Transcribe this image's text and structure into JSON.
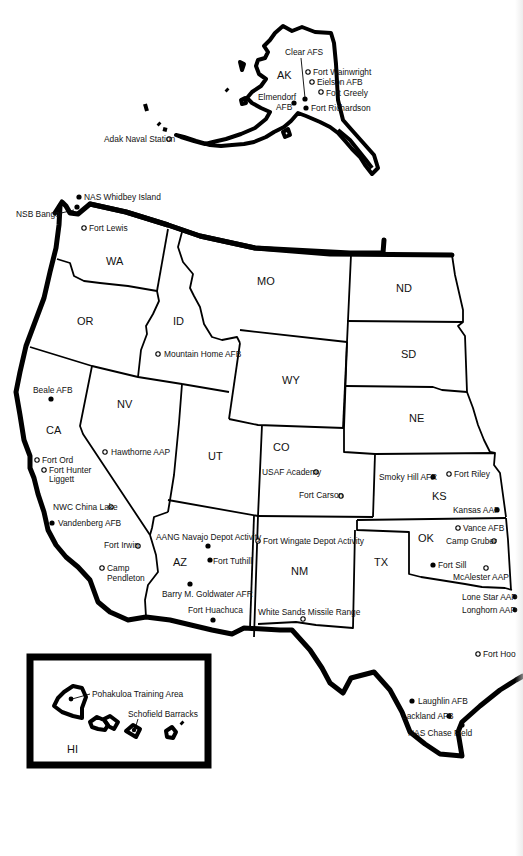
{
  "map": {
    "legend": {
      "filled_dot": "installation (filled marker)",
      "open_dot": "installation (open marker)"
    },
    "states": [
      {
        "code": "AK",
        "x": 277,
        "y": 79
      },
      {
        "code": "WA",
        "x": 107,
        "y": 265
      },
      {
        "code": "OR",
        "x": 84,
        "y": 323
      },
      {
        "code": "ID",
        "x": 177,
        "y": 323
      },
      {
        "code": "MO",
        "x": 264,
        "y": 284
      },
      {
        "code": "ND",
        "x": 403,
        "y": 291
      },
      {
        "code": "SD",
        "x": 407,
        "y": 357
      },
      {
        "code": "WY",
        "x": 290,
        "y": 383
      },
      {
        "code": "NE",
        "x": 415,
        "y": 421
      },
      {
        "code": "CA",
        "x": 53,
        "y": 433
      },
      {
        "code": "NV",
        "x": 123,
        "y": 406
      },
      {
        "code": "UT",
        "x": 215,
        "y": 459
      },
      {
        "code": "CO",
        "x": 280,
        "y": 450
      },
      {
        "code": "KS",
        "x": 438,
        "y": 499
      },
      {
        "code": "OK",
        "x": 425,
        "y": 541
      },
      {
        "code": "TX",
        "x": 381,
        "y": 565
      },
      {
        "code": "AZ",
        "x": 180,
        "y": 565
      },
      {
        "code": "NM",
        "x": 298,
        "y": 574
      },
      {
        "code": "HI",
        "x": 69,
        "y": 754
      }
    ],
    "sites": [
      {
        "name": "Clear AFS",
        "state": "AK",
        "marker": "filled",
        "dx": 305,
        "dy": 99,
        "lx": 283,
        "ly": 53
      },
      {
        "name": "Fort Wainwright",
        "state": "AK",
        "marker": "open",
        "dx": 308,
        "dy": 72,
        "lx": 314,
        "ly": 75
      },
      {
        "name": "Eielson AFB",
        "state": "AK",
        "marker": "open",
        "dx": 312,
        "dy": 82,
        "lx": 318,
        "ly": 85
      },
      {
        "name": "Fort Greely",
        "state": "AK",
        "marker": "open",
        "dx": 321,
        "dy": 92,
        "lx": 327,
        "ly": 95
      },
      {
        "name": "Elmendorf AFB",
        "state": "AK",
        "marker": "filled",
        "dx": 294,
        "dy": 103,
        "lx": 258,
        "ly": 98
      },
      {
        "name": "Fort Richardson",
        "state": "AK",
        "marker": "filled",
        "dx": 306,
        "dy": 108,
        "lx": 312,
        "ly": 111
      },
      {
        "name": "Adak Naval Station",
        "state": "AK",
        "marker": "open",
        "dx": 169,
        "dy": 139,
        "lx": 104,
        "ly": 142
      },
      {
        "name": "NAS Whidbey Island",
        "state": "WA",
        "marker": "filled",
        "dx": 79,
        "dy": 197,
        "lx": 85,
        "ly": 200
      },
      {
        "name": "NSB Bangor",
        "state": "WA",
        "marker": "filled",
        "dx": 77,
        "dy": 207,
        "lx": 16,
        "ly": 216
      },
      {
        "name": "Fort Lewis",
        "state": "WA",
        "marker": "open",
        "dx": 84,
        "dy": 228,
        "lx": 90,
        "ly": 231
      },
      {
        "name": "Mountain Home AFB",
        "state": "ID",
        "marker": "open",
        "dx": 159,
        "dy": 353,
        "lx": 165,
        "ly": 356
      },
      {
        "name": "Beale AFB",
        "state": "CA",
        "marker": "filled",
        "dx": 51,
        "dy": 399,
        "lx": 33,
        "ly": 392
      },
      {
        "name": "Hawthorne AAP",
        "state": "NV",
        "marker": "open",
        "dx": 105,
        "dy": 452,
        "lx": 111,
        "ly": 455
      },
      {
        "name": "Fort Ord",
        "state": "CA",
        "marker": "open",
        "dx": 37,
        "dy": 460,
        "lx": 42,
        "ly": 463
      },
      {
        "name": "Fort Hunter Liggett",
        "state": "CA",
        "marker": "open",
        "dx": 44,
        "dy": 470,
        "lx": 49,
        "ly": 473
      },
      {
        "name": "NWC China Lake",
        "state": "CA",
        "marker": "open",
        "dx": 111,
        "dy": 507,
        "lx": 53,
        "ly": 510
      },
      {
        "name": "Vandenberg AFB",
        "state": "CA",
        "marker": "filled",
        "dx": 52,
        "dy": 523,
        "lx": 58,
        "ly": 526
      },
      {
        "name": "Fort Irwin",
        "state": "CA",
        "marker": "open",
        "dx": 138,
        "dy": 546,
        "lx": 104,
        "ly": 548
      },
      {
        "name": "Camp Pendleton",
        "state": "CA",
        "marker": "open",
        "dx": 102,
        "dy": 568,
        "lx": 107,
        "ly": 571
      },
      {
        "name": "AANG Navajo Depot Activity",
        "state": "AZ",
        "marker": "filled",
        "dx": 208,
        "dy": 546,
        "lx": 157,
        "ly": 539
      },
      {
        "name": "Fort Tuthill",
        "state": "AZ",
        "marker": "filled",
        "dx": 210,
        "dy": 560,
        "lx": 213,
        "ly": 563
      },
      {
        "name": "Barry M. Goldwater AFR",
        "state": "AZ",
        "marker": "filled",
        "dx": 190,
        "dy": 584,
        "lx": 162,
        "ly": 597
      },
      {
        "name": "Fort Huachuca",
        "state": "AZ",
        "marker": "filled",
        "dx": 213,
        "dy": 620,
        "lx": 188,
        "ly": 613
      },
      {
        "name": "Fort Wingate Depot Activity",
        "state": "NM",
        "marker": "open",
        "dx": 258,
        "dy": 541,
        "lx": 264,
        "ly": 544
      },
      {
        "name": "White Sands Missile Range",
        "state": "NM",
        "marker": "open",
        "dx": 303,
        "dy": 619,
        "lx": 258,
        "ly": 615
      },
      {
        "name": "USAF Academy",
        "state": "CO",
        "marker": "open",
        "dx": 316,
        "dy": 472,
        "lx": 262,
        "ly": 475
      },
      {
        "name": "Fort Carson",
        "state": "CO",
        "marker": "open",
        "dx": 341,
        "dy": 496,
        "lx": 299,
        "ly": 498
      },
      {
        "name": "Smoky Hill AFR",
        "state": "KS",
        "marker": "filled",
        "dx": 433,
        "dy": 477,
        "lx": 379,
        "ly": 480
      },
      {
        "name": "Fort Riley",
        "state": "KS",
        "marker": "open",
        "dx": 449,
        "dy": 474,
        "lx": 454,
        "ly": 477
      },
      {
        "name": "Kansas AAP",
        "state": "KS",
        "marker": "filled",
        "dx": 497,
        "dy": 510,
        "lx": 453,
        "ly": 513
      },
      {
        "name": "Vance AFB",
        "state": "OK",
        "marker": "open",
        "dx": 458,
        "dy": 528,
        "lx": 463,
        "ly": 531
      },
      {
        "name": "Camp Gruber",
        "state": "OK",
        "marker": "open",
        "dx": 494,
        "dy": 541,
        "lx": 446,
        "ly": 544
      },
      {
        "name": "Fort Sill",
        "state": "OK",
        "marker": "filled",
        "dx": 433,
        "dy": 565,
        "lx": 438,
        "ly": 568
      },
      {
        "name": "McAlester AAP",
        "state": "OK",
        "marker": "open",
        "dx": 486,
        "dy": 568,
        "lx": 453,
        "ly": 580
      },
      {
        "name": "Lone Star AAP",
        "state": "TX",
        "marker": "filled",
        "dx": 514,
        "dy": 597,
        "lx": 462,
        "ly": 600
      },
      {
        "name": "Longhorn AAP",
        "state": "TX",
        "marker": "filled",
        "dx": 514,
        "dy": 610,
        "lx": 462,
        "ly": 613
      },
      {
        "name": "Fort Hood",
        "state": "TX",
        "marker": "open",
        "dx": 478,
        "dy": 654,
        "lx": 483,
        "ly": 657
      },
      {
        "name": "Laughlin AFB",
        "state": "TX",
        "marker": "filled",
        "dx": 412,
        "dy": 701,
        "lx": 418,
        "ly": 704
      },
      {
        "name": "Lackland AFB",
        "state": "TX",
        "marker": "filled",
        "dx": 449,
        "dy": 716,
        "lx": 402,
        "ly": 719
      },
      {
        "name": "NAS Chase Field",
        "state": "TX",
        "marker": "filled",
        "dx": 462,
        "dy": 725,
        "lx": 408,
        "ly": 736
      },
      {
        "name": "Pohakuloa Training Area",
        "state": "HI",
        "marker": "filled",
        "dx": 71,
        "dy": 699,
        "lx": 93,
        "ly": 696
      },
      {
        "name": "Schofield Barracks",
        "state": "HI",
        "marker": "filled",
        "dx": 134,
        "dy": 730,
        "lx": 128,
        "ly": 716
      }
    ],
    "site_labels_display": {
      "clear_afs": "Clear AFS",
      "fort_wainwright": "Fort Wainwright",
      "eielson_afb": "Eielson AFB",
      "fort_greely": "Fort Greely",
      "elmendorf_1": "Elmendorf",
      "elmendorf_2": "AFB",
      "fort_richardson": "Fort Richardson",
      "adak": "Adak Naval Station",
      "whidbey": "NAS Whidbey Island",
      "bangor": "NSB Bangor",
      "fort_lewis": "Fort Lewis",
      "mountain_home": "Mountain Home AFB",
      "beale": "Beale AFB",
      "hawthorne": "Hawthorne AAP",
      "fort_ord": "Fort Ord",
      "hunter_liggett_1": "Fort Hunter",
      "hunter_liggett_2": "Liggett",
      "china_lake": "NWC China Lake",
      "vandenberg": "Vandenberg AFB",
      "fort_irwin": "Fort Irwin",
      "pendleton_1": "Camp",
      "pendleton_2": "Pendleton",
      "navajo": "AANG Navajo Depot Activity",
      "tuthill": "Fort Tuthill",
      "goldwater": "Barry M. Goldwater AFR",
      "huachuca": "Fort Huachuca",
      "wingate": "Fort Wingate Depot Activity",
      "white_sands": "White Sands Missile Range",
      "usaf_academy": "USAF Academy",
      "fort_carson": "Fort Carson",
      "smoky_hill": "Smoky Hill AFR",
      "fort_riley": "Fort Riley",
      "kansas_aap": "Kansas AAP",
      "vance": "Vance AFB",
      "camp_gruber": "Camp Gruber",
      "fort_sill": "Fort Sill",
      "mcalester": "McAlester AAP",
      "lone_star": "Lone Star AAP",
      "longhorn": "Longhorn AAP",
      "fort_hood": "Fort Hoo",
      "laughlin": "Laughlin AFB",
      "lackland": "Lackland AFB",
      "chase_field": "NAS Chase Field",
      "pohakuloa": "Pohakuloa Training Area",
      "schofield": "Schofield Barracks"
    }
  }
}
